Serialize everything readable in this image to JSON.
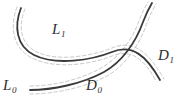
{
  "figure": {
    "name": "two-crossing-curves-with-dashed-neighborhoods",
    "background_color": "#ffffff",
    "curve_color": "#3a3a3a",
    "dashed_color": "#c8c8c8",
    "label_color": "#2e2e2e",
    "width": 185,
    "height": 110
  },
  "labels": {
    "L1": {
      "base": "L",
      "sub": "1"
    },
    "L0": {
      "base": "L",
      "sub": "0"
    },
    "D1": {
      "base": "D",
      "sub": "1"
    },
    "D0": {
      "base": "D",
      "sub": "0"
    }
  },
  "curves": {
    "L_curve": {
      "name": "L-curve",
      "label_start": "L0",
      "label_mid": "L1",
      "label_end": "D1",
      "path": "M 21 8 C 14 26, 16 46, 34 55 C 56 66, 92 60, 112 52 C 132 44, 146 55, 160 80"
    },
    "D_curve": {
      "name": "D-curve",
      "label_start": "L0",
      "label_mid": "D0",
      "label_end": "D1",
      "path": "M 30 90 C 52 90, 82 84, 104 72 C 122 62, 136 42, 143 22 C 146 14, 149 8, 152 3"
    },
    "L_curve_upper_dash": {
      "path": "M 17 7 C 10 26, 12 48, 32 58 C 56 70, 92 64, 112 56 C 130 49, 143 57, 156 81"
    },
    "L_curve_lower_dash": {
      "path": "M 25 9 C 18 26, 20 44, 37 52 C 57 62, 92 56, 112 48 C 134 39, 149 53, 164 79"
    },
    "D_curve_upper_dash": {
      "path": "M 30 86 C 52 86, 80 80, 101 68 C 119 58, 132 40, 139 21 C 142 13, 145 7, 148 2"
    },
    "D_curve_lower_dash": {
      "path": "M 30 94 C 53 94, 84 88, 107 76 C 125 66, 140 44, 147 23 C 150 15, 153 9, 156 4"
    }
  }
}
